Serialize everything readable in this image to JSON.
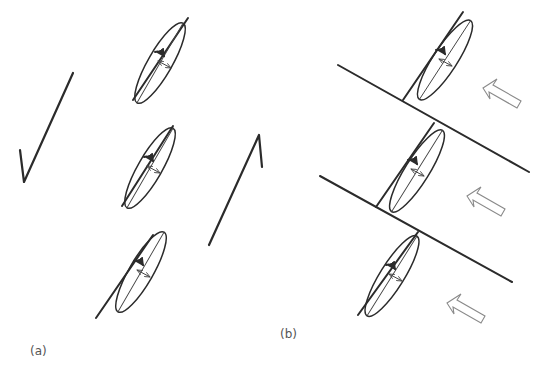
{
  "figure": {
    "header_text": "",
    "panels": [
      {
        "id": "a",
        "label": "(a)",
        "shapes": [
          {
            "name": "check-stroke",
            "points": [
              [
                20,
                150
              ],
              [
                24,
                182
              ],
              [
                73,
                73
              ]
            ]
          },
          {
            "name": "mirrored-check-stroke",
            "points": [
              [
                209,
                245
              ],
              [
                259,
                135
              ],
              [
                262,
                167
              ]
            ]
          }
        ],
        "units": [
          {
            "ellipse": {
              "cx": 160,
              "cy": 63,
              "rx": 12,
              "ry": 46,
              "angle": 30
            },
            "tangent": [
              [
                133,
                100
              ],
              [
                188,
                18
              ]
            ]
          },
          {
            "ellipse": {
              "cx": 150,
              "cy": 168,
              "rx": 12,
              "ry": 46,
              "angle": 30
            },
            "tangent": [
              [
                122,
                206
              ],
              [
                173,
                126
              ]
            ]
          },
          {
            "ellipse": {
              "cx": 141,
              "cy": 272,
              "rx": 12,
              "ry": 46,
              "angle": 30
            },
            "tangent": [
              [
                96,
                318
              ],
              [
                153,
                235
              ]
            ]
          }
        ]
      },
      {
        "id": "b",
        "label": "(b)",
        "boundary_lines": [
          [
            [
              338,
              65
            ],
            [
              529,
              172
            ]
          ],
          [
            [
              320,
              176
            ],
            [
              512,
              282
            ]
          ]
        ],
        "units": [
          {
            "ellipse": {
              "cx": 445,
              "cy": 60,
              "rx": 12,
              "ry": 47,
              "angle": 33
            },
            "tangent": [
              [
                403,
                100
              ],
              [
                463,
                12
              ]
            ]
          },
          {
            "ellipse": {
              "cx": 417,
              "cy": 171,
              "rx": 12,
              "ry": 48,
              "angle": 32
            },
            "tangent": [
              [
                376,
                207
              ],
              [
                434,
                123
              ]
            ]
          },
          {
            "ellipse": {
              "cx": 392,
              "cy": 276,
              "rx": 12,
              "ry": 47,
              "angle": 32
            },
            "tangent": [
              [
                358,
                315
              ],
              [
                418,
                232
              ]
            ]
          }
        ],
        "flow_arrows": [
          {
            "tip": [
              483,
              88
            ],
            "direction": "up-left"
          },
          {
            "tip": [
              467,
              196
            ],
            "direction": "up-left"
          },
          {
            "tip": [
              447,
              303
            ],
            "direction": "up-left"
          }
        ]
      }
    ]
  }
}
